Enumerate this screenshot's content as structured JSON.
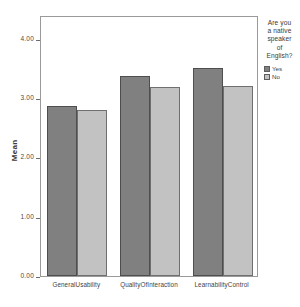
{
  "chart_data": {
    "type": "bar",
    "title": "",
    "subtitle": "",
    "xlabel": "",
    "ylabel": "Mean",
    "ylim": [
      0,
      4.4
    ],
    "grid": false,
    "legend_position": "right",
    "categories": [
      "GeneralUsability",
      "QualityOfInteraction",
      "LearnabilityControl"
    ],
    "ytick_labels": [
      "0.00",
      "1.00",
      "2.00",
      "3.00",
      "4.00"
    ],
    "ytick_values": [
      0,
      1,
      2,
      3,
      4
    ],
    "legend_title": "Are you a native speaker of English?",
    "series": [
      {
        "name": "Yes",
        "color": "#808080",
        "values": [
          2.87,
          3.37,
          3.5
        ]
      },
      {
        "name": "No",
        "color": "#c2c2c2",
        "values": [
          2.8,
          3.18,
          3.21
        ]
      }
    ]
  },
  "axis": {
    "y_title": "Mean"
  },
  "legend": {
    "title_lines": [
      "Are you",
      "a native",
      "speaker",
      "of",
      "English?"
    ],
    "entries": [
      {
        "label": "Yes",
        "color": "#808080"
      },
      {
        "label": "No",
        "color": "#c2c2c2"
      }
    ]
  }
}
